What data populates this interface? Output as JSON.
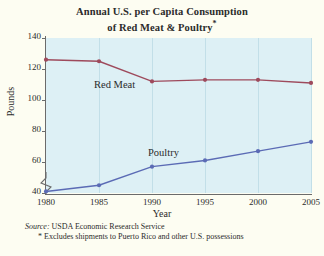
{
  "chart_data": {
    "type": "line",
    "title_line1": "Annual U.S. per Capita Consumption",
    "title_line2": "of Red Meat & Poultry",
    "title_marker": "*",
    "xlabel": "Year",
    "ylabel": "Pounds",
    "x": [
      1980,
      1985,
      1990,
      1995,
      2000,
      2005
    ],
    "xtick_labels": [
      "1980",
      "1985",
      "1990",
      "1995",
      "2000",
      "2005"
    ],
    "ytick_labels": [
      "40",
      "60",
      "80",
      "100",
      "120",
      "140"
    ],
    "yticks": [
      40,
      60,
      80,
      100,
      120,
      140
    ],
    "ylim": [
      40,
      140
    ],
    "xlim": [
      1980,
      2005
    ],
    "y_axis_break": true,
    "grid": "vertical",
    "legend_position": "inline-labels",
    "series": [
      {
        "name": "Red Meat",
        "color": "#9e4a5c",
        "values": [
          126,
          125,
          112,
          113,
          113,
          111
        ]
      },
      {
        "name": "Poultry",
        "color": "#5b6bb5",
        "values": [
          41,
          45,
          57,
          61,
          67,
          73
        ]
      }
    ]
  },
  "footnotes": {
    "source_word": "Source:",
    "source_text": " USDA Economic Research Service",
    "note": "* Excludes shipments to Puerto Rico and other U.S. possessions"
  },
  "colors": {
    "page_background": "#fdfdf2",
    "plot_background": "#ddf0f5",
    "gridline": "#c2dfe8",
    "axis": "#6b6b6b",
    "red_meat": "#9e4a5c",
    "poultry": "#5b6bb5"
  }
}
